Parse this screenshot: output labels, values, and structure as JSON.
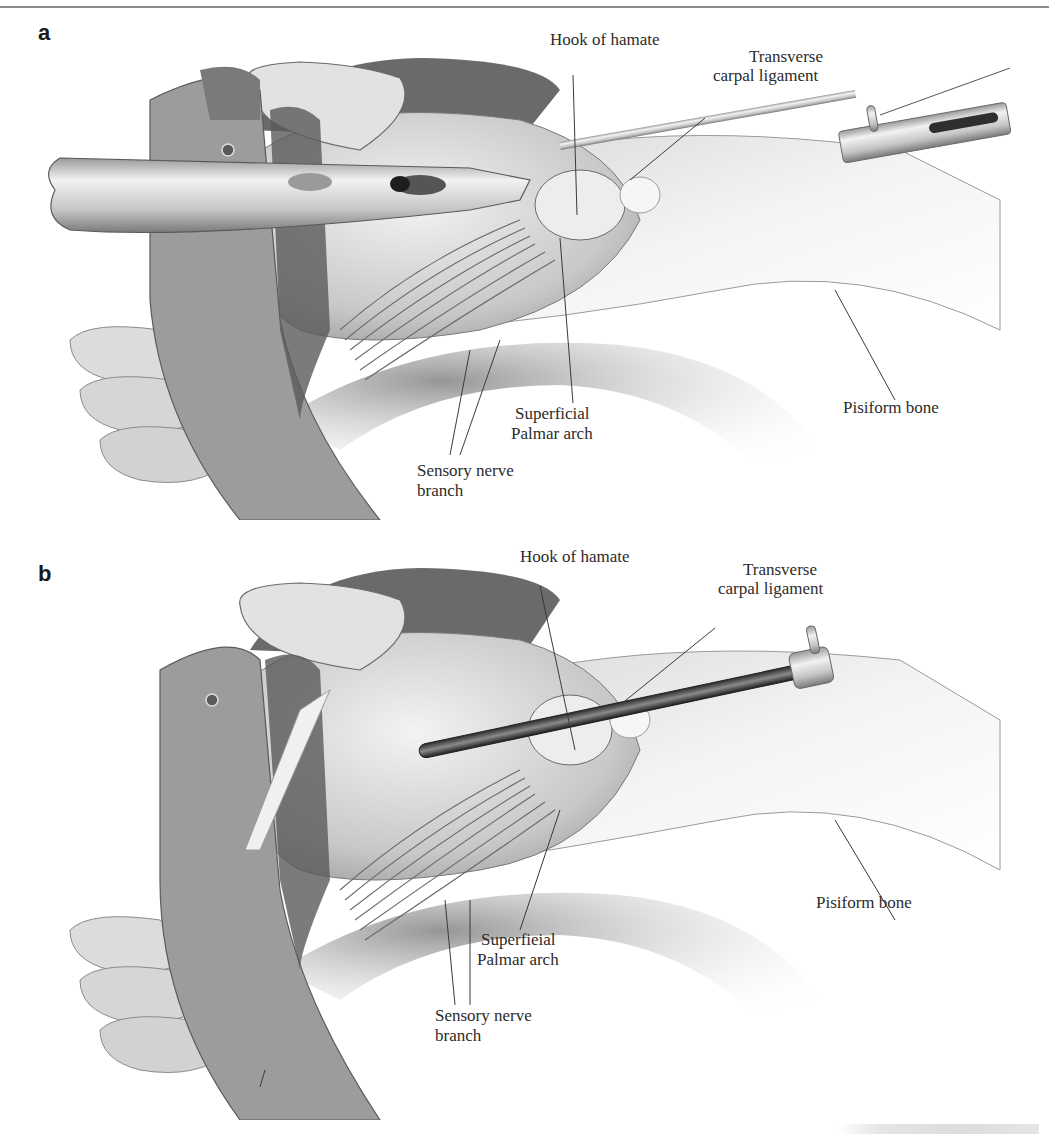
{
  "figure": {
    "panels": [
      {
        "letter": "a",
        "description": "Endoscopic carpal tunnel release – blade assembly inserted beneath transverse carpal ligament",
        "labels": {
          "hook_of_hamate": "Hook of hamate",
          "transverse_1": "Transverse",
          "transverse_2": "carpal ligament",
          "pisiform": "Pisiform bone",
          "superficial_1": "Superficial",
          "superficial_2": "Palmar arch",
          "sensory_1": "Sensory nerve",
          "sensory_2": "branch"
        }
      },
      {
        "letter": "b",
        "description": "Cannula/tube in position beneath transverse carpal ligament",
        "labels": {
          "hook_of_hamate": "Hook of hamate",
          "transverse_1": "Transverse",
          "transverse_2": "carpal ligament",
          "pisiform": "Pisiform bone",
          "superficial_1": "Superfieial",
          "superficial_2": "Palmar arch",
          "sensory_1": "Sensory nerve",
          "sensory_2": "branch"
        }
      }
    ],
    "colors": {
      "ink": "#2c2c2c",
      "skin_light": "#e6e6e6",
      "skin_mid": "#bdbdbd",
      "drape_dark": "#6e6e6e",
      "metal": "#cfcfcf"
    }
  }
}
